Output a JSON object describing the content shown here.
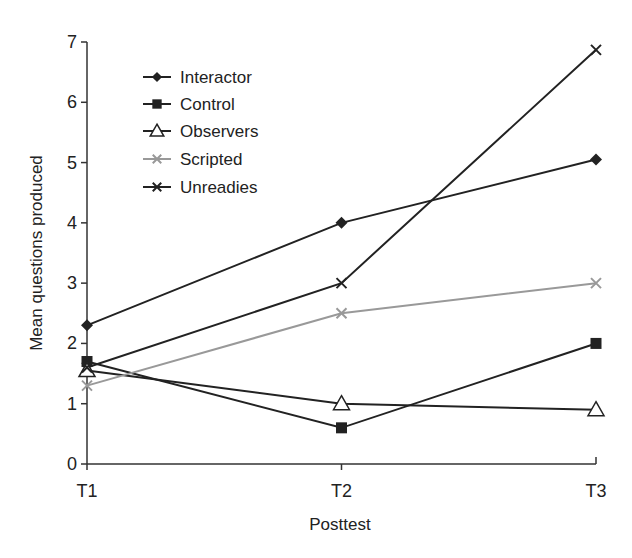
{
  "chart_data": {
    "type": "line",
    "title": "",
    "xlabel": "Posttest",
    "ylabel": "Mean questions produced",
    "categories": [
      "T1",
      "T2",
      "T3"
    ],
    "ylim": [
      0,
      7
    ],
    "yticks": [
      0,
      1,
      2,
      3,
      4,
      5,
      6,
      7
    ],
    "grid": false,
    "legend_position": "upper-left",
    "series": [
      {
        "name": "Interactor",
        "marker": "diamond",
        "color": "#222222",
        "values": [
          2.3,
          4.0,
          5.05
        ]
      },
      {
        "name": "Control",
        "marker": "square",
        "color": "#222222",
        "values": [
          1.7,
          0.6,
          2.0
        ]
      },
      {
        "name": "Observers",
        "marker": "open-triangle",
        "color": "#222222",
        "values": [
          1.55,
          1.0,
          0.9
        ]
      },
      {
        "name": "Scripted",
        "marker": "x",
        "color": "#999999",
        "values": [
          1.3,
          2.5,
          3.0
        ]
      },
      {
        "name": "Unreadies",
        "marker": "x",
        "color": "#222222",
        "values": [
          1.6,
          3.0,
          6.87
        ]
      }
    ]
  }
}
